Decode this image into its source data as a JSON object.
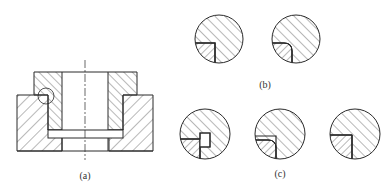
{
  "figure": {
    "labels": {
      "a": "(a)",
      "b": "(b)",
      "c": "(c)"
    },
    "panels": [
      {
        "id": "a",
        "description": "Sectional view of a flanged bushing seated in a counterbored housing, with detail circle at the flange corner"
      },
      {
        "id": "b",
        "description": "Two enlarged detail views of the corner: sharp corner and rounded corner"
      },
      {
        "id": "c",
        "description": "Three enlarged detail views of alternative relief-groove corner treatments"
      }
    ],
    "colors": {
      "line": "#2a2a2a",
      "background": "#ffffff"
    }
  }
}
